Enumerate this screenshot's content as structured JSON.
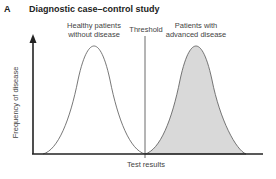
{
  "panel": {
    "letter": "A",
    "title": "Diagnostic case–control study"
  },
  "labels": {
    "healthy_line1": "Healthy patients",
    "healthy_line2": "without disease",
    "threshold": "Threshold",
    "advanced_line1": "Patients with",
    "advanced_line2": "advanced disease",
    "x_axis": "Test results",
    "y_axis": "Frequency of disease"
  },
  "colors": {
    "curve": "#555555",
    "fill": "#d9d9d9",
    "axis": "#222222"
  },
  "curves": [
    {
      "name": "Healthy patients without disease",
      "peak_x": "left",
      "shaded": false
    },
    {
      "name": "Patients with advanced disease",
      "peak_x": "right",
      "shaded": true
    }
  ]
}
